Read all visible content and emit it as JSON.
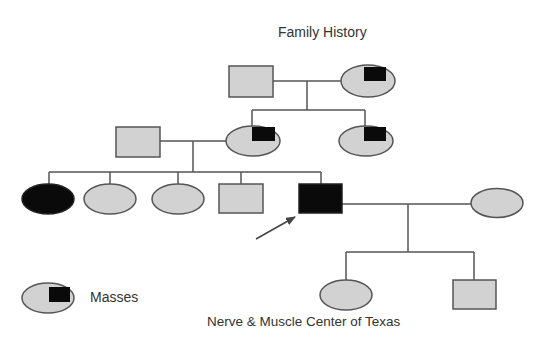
{
  "title": "Family History",
  "legend": {
    "label": "Masses",
    "symbol": "female-with-mass-marker"
  },
  "credit": "Nerve & Muscle Center of Texas",
  "colors": {
    "unaffected_fill": "#d2d2d2",
    "affected_fill": "#0a0a0a",
    "marker_fill": "#0a0a0a",
    "outline": "#555555",
    "line": "#555555",
    "text": "#333333"
  },
  "pedigree": {
    "generations": [
      {
        "generation": 1,
        "members": [
          {
            "id": "g1-father",
            "sex": "male",
            "status": "unaffected"
          },
          {
            "id": "g1-mother",
            "sex": "female",
            "status": "masses"
          }
        ]
      },
      {
        "generation": 2,
        "members": [
          {
            "id": "g2-husband",
            "sex": "male",
            "status": "unaffected"
          },
          {
            "id": "g2-daughter-1",
            "sex": "female",
            "status": "masses"
          },
          {
            "id": "g2-daughter-2",
            "sex": "female",
            "status": "masses"
          }
        ]
      },
      {
        "generation": 3,
        "members": [
          {
            "id": "g3-daughter-1",
            "sex": "female",
            "status": "affected"
          },
          {
            "id": "g3-daughter-2",
            "sex": "female",
            "status": "unaffected"
          },
          {
            "id": "g3-daughter-3",
            "sex": "female",
            "status": "unaffected"
          },
          {
            "id": "g3-son-1",
            "sex": "male",
            "status": "unaffected"
          },
          {
            "id": "g3-proband",
            "sex": "male",
            "status": "affected",
            "proband": true
          },
          {
            "id": "g3-proband-spouse",
            "sex": "female",
            "status": "unaffected"
          }
        ]
      },
      {
        "generation": 4,
        "members": [
          {
            "id": "g4-daughter",
            "sex": "female",
            "status": "unaffected"
          },
          {
            "id": "g4-son",
            "sex": "male",
            "status": "unaffected"
          }
        ]
      }
    ]
  }
}
